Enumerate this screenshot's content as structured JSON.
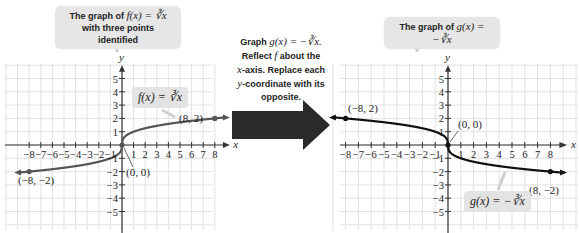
{
  "left_graph": {
    "callout_line1": "The graph of",
    "callout_math": "f(x) = ∛x",
    "callout_line2": "with three points identified",
    "function_label": "f(x) = ∛x",
    "points": [
      {
        "label": "(8, 2)",
        "x": 8,
        "y": 2
      },
      {
        "label": "(0, 0)",
        "x": 0,
        "y": 0
      },
      {
        "label": "(−8, −2)",
        "x": -8,
        "y": -2
      }
    ],
    "x_axis_label": "x",
    "y_axis_label": "y"
  },
  "transform_note": {
    "line1_text": "Graph",
    "line1_math": "g(x) = −∛x.",
    "line2_text": "Reflect",
    "line2_math": "f",
    "line2_rest": "about the",
    "line3_math": "x",
    "line3_rest": "-axis. Replace each",
    "line4_math": "y",
    "line4_rest": "-coordinate with its",
    "line5": "opposite."
  },
  "right_graph": {
    "callout_line1": "The graph of",
    "callout_math": "g(x) = −∛x",
    "function_label": "g(x) = −∛x",
    "points": [
      {
        "label": "(−8, 2)",
        "x": -8,
        "y": 2
      },
      {
        "label": "(0, 0)",
        "x": 0,
        "y": 0
      },
      {
        "label": "(8, −2)",
        "x": 8,
        "y": -2
      }
    ],
    "x_axis_label": "x",
    "y_axis_label": "y"
  },
  "axes": {
    "x_ticks": [
      "−8",
      "−7",
      "−6",
      "−5",
      "−4",
      "−3",
      "−2",
      "−1",
      "1",
      "2",
      "3",
      "4",
      "5",
      "6",
      "7",
      "8"
    ],
    "y_ticks_pos": [
      "1",
      "2",
      "3",
      "4",
      "5"
    ],
    "y_ticks_neg": [
      "−1",
      "−2",
      "−3",
      "−4",
      "−5"
    ]
  },
  "colors": {
    "grid": "#e2e2e2",
    "axis": "#333333",
    "curve_left": "#555555",
    "curve_right": "#111111",
    "callout_bg": "#e6e6e6",
    "arrow": "#2a2a2a"
  }
}
